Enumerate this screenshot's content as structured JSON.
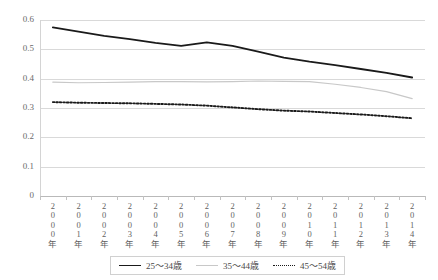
{
  "chart_data": {
    "type": "line",
    "title": "",
    "xlabel": "",
    "ylabel": "",
    "ylim": [
      0,
      0.6
    ],
    "grid": true,
    "legend_position": "bottom",
    "categories": [
      "2000年",
      "2001年",
      "2002年",
      "2003年",
      "2004年",
      "2005年",
      "2006年",
      "2007年",
      "2008年",
      "2009年",
      "2010年",
      "2011年",
      "2012年",
      "2013年",
      "2014年"
    ],
    "series": [
      {
        "name": "25～34歳",
        "style": "solid",
        "color": "#1a1a1a",
        "values": [
          0.575,
          0.56,
          0.546,
          0.535,
          0.522,
          0.512,
          0.524,
          0.512,
          0.492,
          0.472,
          0.458,
          0.446,
          0.433,
          0.42,
          0.404
        ]
      },
      {
        "name": "35～44歳",
        "style": "solid",
        "color": "#c8c8c8",
        "values": [
          0.388,
          0.386,
          0.387,
          0.388,
          0.39,
          0.39,
          0.389,
          0.39,
          0.392,
          0.391,
          0.39,
          0.381,
          0.37,
          0.356,
          0.332
        ]
      },
      {
        "name": "45～54歳",
        "style": "dotted",
        "color": "#1a1a1a",
        "values": [
          0.32,
          0.318,
          0.317,
          0.316,
          0.314,
          0.312,
          0.308,
          0.302,
          0.296,
          0.291,
          0.288,
          0.283,
          0.278,
          0.272,
          0.265
        ]
      }
    ],
    "yticks": [
      "0",
      "0.1",
      "0.2",
      "0.3",
      "0.4",
      "0.5",
      "0.6"
    ],
    "ytick_values": [
      0,
      0.1,
      0.2,
      0.3,
      0.4,
      0.5,
      0.6
    ]
  },
  "legend": {
    "items": [
      {
        "label": "25～34歳"
      },
      {
        "label": "35～44歳"
      },
      {
        "label": "45～54歳"
      }
    ]
  }
}
